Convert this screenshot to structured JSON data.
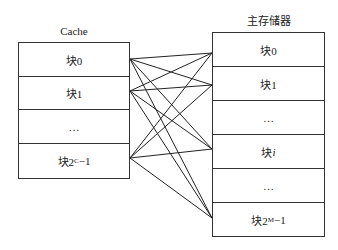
{
  "cache": {
    "title": "Cache",
    "blocks": [
      {
        "label": "块0"
      },
      {
        "label": "块1"
      },
      {
        "label": "…"
      },
      {
        "label": "块2",
        "sup": "C",
        "suffix": "−1"
      }
    ]
  },
  "main_memory": {
    "title": "主存储器",
    "blocks": [
      {
        "label": "块0"
      },
      {
        "label": "块1"
      },
      {
        "label": "…"
      },
      {
        "label": "块",
        "italic": "i"
      },
      {
        "label": "…"
      },
      {
        "label": "块2",
        "sup": "M",
        "suffix": "−1"
      }
    ]
  },
  "connections": {
    "from_cache_blocks": [
      0,
      1,
      3
    ],
    "to_memory_blocks": [
      0,
      1,
      3,
      5
    ],
    "type": "fully-associative"
  }
}
